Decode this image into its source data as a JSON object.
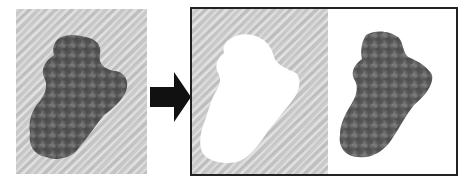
{
  "figure": {
    "panels": [
      {
        "id": "original",
        "label": "Original lesion image"
      },
      {
        "id": "background",
        "label": "Background (lesion masked out)"
      },
      {
        "id": "lesion",
        "label": "Segmented lesion"
      }
    ],
    "arrow": {
      "direction": "right",
      "color": "#111111"
    },
    "colors": {
      "skin": "#c9c9c9",
      "lesion_dark": "#4a4a4a",
      "lesion_mid": "#6e6e6e",
      "mask": "#ffffff",
      "border": "#222222"
    }
  }
}
